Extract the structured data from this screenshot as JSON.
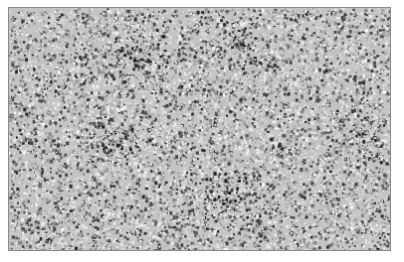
{
  "image": {
    "kind": "micrograph",
    "description": "Grayscale histology micrograph showing densely packed cells with darker clustered regions",
    "palette": {
      "background": "#ffffff",
      "border": "#8a8a8a",
      "light": "#d8d8d8",
      "mid": "#a0a0a0",
      "dark": "#3a3a3a"
    },
    "dark_regions": [
      {
        "cx": 0.35,
        "cy": 0.22,
        "r": 0.1
      },
      {
        "cx": 0.6,
        "cy": 0.15,
        "r": 0.09
      },
      {
        "cx": 0.58,
        "cy": 0.8,
        "r": 0.12
      },
      {
        "cx": 0.27,
        "cy": 0.55,
        "r": 0.08
      },
      {
        "cx": 0.92,
        "cy": 0.52,
        "r": 0.07
      }
    ]
  }
}
